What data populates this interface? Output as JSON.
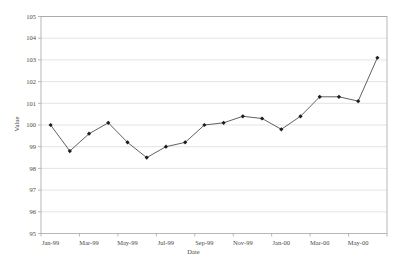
{
  "chart_data": {
    "type": "line",
    "title": "",
    "xlabel": "Date",
    "ylabel": "Value",
    "x": [
      "Jan-99",
      "Feb-99",
      "Mar-99",
      "Apr-99",
      "May-99",
      "Jun-99",
      "Jul-99",
      "Aug-99",
      "Sep-99",
      "Oct-99",
      "Nov-99",
      "Dec-99",
      "Jan-00",
      "Feb-00",
      "Mar-00",
      "Apr-00",
      "May-00",
      "Jun-00"
    ],
    "x_tick_labels": [
      "Jan-99",
      "Mar-99",
      "May-99",
      "Jul-99",
      "Sep-99",
      "Nov-99",
      "Jan-00",
      "Mar-00",
      "May-00"
    ],
    "x_label_every": 2,
    "series": [
      {
        "name": "Value",
        "values": [
          100.0,
          98.8,
          99.6,
          100.1,
          99.2,
          98.5,
          99.0,
          99.2,
          100.0,
          100.1,
          100.4,
          100.3,
          99.8,
          100.4,
          101.3,
          101.3,
          101.1,
          103.1
        ],
        "marker": "diamond"
      }
    ],
    "ylim": [
      95,
      105
    ],
    "ytick_step": 1,
    "grid": "horizontal",
    "legend": "none",
    "colors": {
      "line": "#4f4f4f",
      "marker": "#1c1c1c",
      "grid": "#d8d8d8",
      "axis": "#a6a6a6",
      "text": "#4a4a44",
      "background": "#ffffff"
    }
  }
}
